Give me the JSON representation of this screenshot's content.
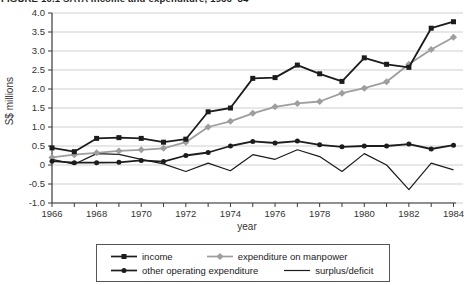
{
  "figure": {
    "title": "FIGURE 10.1 SATA income and expenditure, 1966–84"
  },
  "chart_data": {
    "type": "line",
    "title": "FIGURE 10.1 SATA income and expenditure, 1966–84",
    "xlabel": "year",
    "ylabel": "S$ millions",
    "x": [
      1966,
      1967,
      1968,
      1969,
      1970,
      1971,
      1972,
      1973,
      1974,
      1975,
      1976,
      1977,
      1978,
      1979,
      1980,
      1981,
      1982,
      1983,
      1984
    ],
    "series": [
      {
        "name": "income",
        "marker": "square",
        "color": "#1c1c1c",
        "values": [
          0.45,
          0.35,
          0.7,
          0.72,
          0.7,
          0.6,
          0.68,
          1.4,
          1.5,
          2.28,
          2.3,
          2.63,
          2.4,
          2.2,
          2.82,
          2.65,
          2.57,
          3.6,
          3.77
        ]
      },
      {
        "name": "expenditure on manpower",
        "marker": "diamond",
        "color": "#9e9e9e",
        "values": [
          0.2,
          0.27,
          0.32,
          0.37,
          0.4,
          0.44,
          0.6,
          1.0,
          1.15,
          1.36,
          1.53,
          1.62,
          1.67,
          1.89,
          2.02,
          2.19,
          2.65,
          3.04,
          3.36
        ]
      },
      {
        "name": "other operating expenditure",
        "marker": "circle",
        "color": "#1c1c1c",
        "values": [
          0.1,
          0.06,
          0.06,
          0.07,
          0.12,
          0.09,
          0.25,
          0.33,
          0.5,
          0.62,
          0.58,
          0.63,
          0.53,
          0.48,
          0.5,
          0.5,
          0.55,
          0.42,
          0.52
        ]
      },
      {
        "name": "surplus/deficit",
        "marker": "none",
        "color": "#1c1c1c",
        "values": [
          0.15,
          0.02,
          0.3,
          0.28,
          0.15,
          0.03,
          -0.17,
          0.05,
          -0.15,
          0.27,
          0.15,
          0.4,
          0.22,
          -0.17,
          0.3,
          0.0,
          -0.65,
          0.05,
          -0.13
        ]
      }
    ],
    "ylim": [
      -1.0,
      4.0
    ],
    "ytick_step": 0.5,
    "ytick_labels": [
      "4.0",
      "3.5",
      "3.0",
      "2.5",
      "2.0",
      "1.5",
      "1.0",
      "0.5",
      "0",
      "-0.5",
      "-1.0"
    ],
    "xtick_labels": [
      "1966",
      "1968",
      "1970",
      "1972",
      "1974",
      "1976",
      "1978",
      "1980",
      "1982",
      "1984"
    ],
    "grid": true,
    "legend_position": "bottom"
  },
  "colors": {
    "grid": "#cfcfcf",
    "axis": "#3a3a3a",
    "text": "#333333"
  }
}
